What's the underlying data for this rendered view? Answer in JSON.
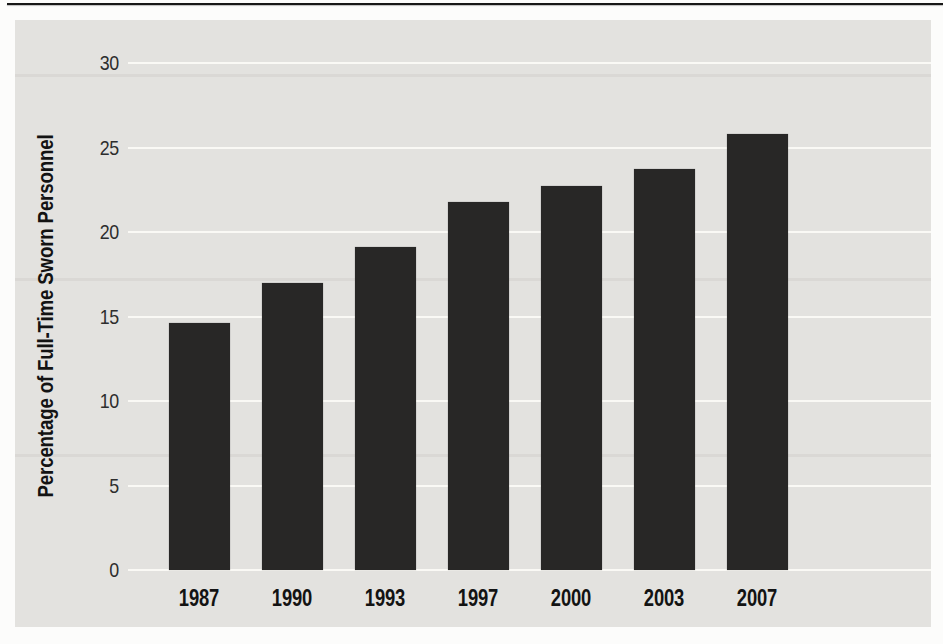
{
  "page": {
    "background": "#fcfcfb",
    "top_rule_color": "#171717"
  },
  "chart_data": {
    "type": "bar",
    "title": "",
    "xlabel": "",
    "ylabel": "Percentage of Full-Time Sworn Personnel",
    "categories": [
      "1987",
      "1990",
      "1993",
      "1997",
      "2000",
      "2003",
      "2007"
    ],
    "values": [
      14.6,
      17.0,
      19.1,
      21.8,
      22.7,
      23.7,
      25.8
    ],
    "yticks": [
      0,
      5,
      10,
      15,
      20,
      25,
      30
    ],
    "ylim": [
      0,
      32.5
    ],
    "grid": true,
    "legend_position": "none",
    "bar_color": "#282726",
    "panel_bg": "#e3e2df",
    "gridline_color": "#faf9f5",
    "tick_text_color": "#2d2d2d",
    "label_text_color": "#131313"
  }
}
